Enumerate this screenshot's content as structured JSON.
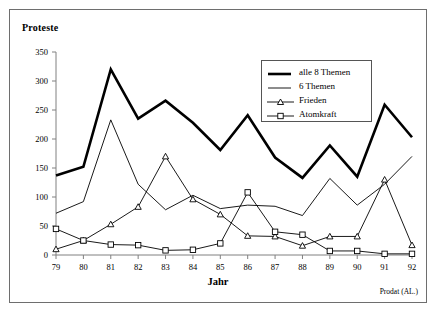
{
  "figure": {
    "y_axis_title": "Proteste",
    "x_axis_title": "Jahr",
    "source_note": "Prodat (AL.)"
  },
  "legend": {
    "items": [
      {
        "label": "alle 8 Themen",
        "style": "thick-line",
        "marker": "none",
        "color": "#000000"
      },
      {
        "label": "6 Themen",
        "style": "thin-line",
        "marker": "none",
        "color": "#000000"
      },
      {
        "label": "Frieden",
        "style": "thin-line",
        "marker": "triangle",
        "color": "#000000"
      },
      {
        "label": "Atomkraft",
        "style": "thin-line",
        "marker": "square",
        "color": "#000000"
      }
    ]
  },
  "chart_data": {
    "type": "line",
    "title": "",
    "subtitle": "",
    "xlabel": "Jahr",
    "ylabel": "Proteste",
    "annotation": "Prodat (AL.)",
    "categories": [
      "79",
      "80",
      "81",
      "82",
      "83",
      "84",
      "85",
      "86",
      "87",
      "88",
      "89",
      "90",
      "91",
      "92"
    ],
    "x": [
      79,
      80,
      81,
      82,
      83,
      84,
      85,
      86,
      87,
      88,
      89,
      90,
      91,
      92
    ],
    "xtick_labels": [
      "79",
      "80",
      "81",
      "82",
      "83",
      "84",
      "85",
      "86",
      "87",
      "88",
      "89",
      "90",
      "91",
      "92"
    ],
    "ytick_labels": [
      "0",
      "50",
      "100",
      "150",
      "200",
      "250",
      "300",
      "350"
    ],
    "yticks": [
      0,
      50,
      100,
      150,
      200,
      250,
      300,
      350
    ],
    "ylim": [
      0,
      350
    ],
    "xlim": [
      79,
      92
    ],
    "grid": false,
    "legend_position": "upper-right",
    "series": [
      {
        "name": "alle 8 Themen",
        "marker": "none",
        "linewidth": "thick",
        "color": "#000000",
        "values": [
          137,
          152,
          320,
          235,
          266,
          228,
          181,
          241,
          168,
          133,
          189,
          135,
          259,
          203
        ]
      },
      {
        "name": "6 Themen",
        "marker": "none",
        "linewidth": "thin",
        "color": "#000000",
        "values": [
          72,
          92,
          233,
          122,
          78,
          103,
          80,
          86,
          84,
          68,
          132,
          86,
          122,
          170
        ]
      },
      {
        "name": "Frieden",
        "marker": "triangle",
        "linewidth": "thin",
        "color": "#000000",
        "values": [
          10,
          25,
          53,
          83,
          170,
          96,
          70,
          33,
          32,
          16,
          32,
          32,
          130,
          17
        ]
      },
      {
        "name": "Atomkraft",
        "marker": "square",
        "linewidth": "thin",
        "color": "#000000",
        "values": [
          45,
          25,
          18,
          17,
          8,
          9,
          20,
          108,
          40,
          35,
          7,
          7,
          2,
          2
        ]
      }
    ]
  }
}
